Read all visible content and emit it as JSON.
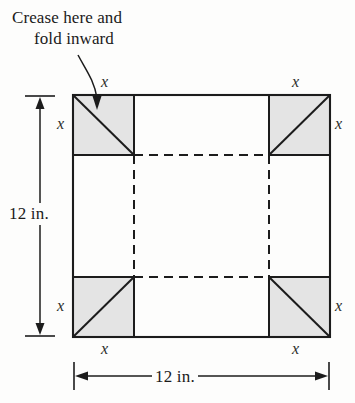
{
  "figure": {
    "title_annotation": {
      "line1": "Crease here and",
      "line2": "fold inward"
    },
    "dimensions": {
      "vertical_label": "12 in.",
      "horizontal_label": "12 in."
    },
    "corner_labels": {
      "top_left_top": "x",
      "top_left_side": "x",
      "top_right_top": "x",
      "top_right_side": "x",
      "bottom_left_side": "x",
      "bottom_left_bottom": "x",
      "bottom_right_side": "x",
      "bottom_right_bottom": "x"
    },
    "colors": {
      "corner_fill": "#e4e4e4",
      "sheet_fill": "#fefefe",
      "stroke": "#1c1c1c",
      "background": "#fdfdfc"
    },
    "geometry": {
      "sheet_left": 73,
      "sheet_top": 95,
      "sheet_right": 330,
      "sheet_bottom": 337,
      "corner_width": 61,
      "corner_height": 60
    }
  }
}
